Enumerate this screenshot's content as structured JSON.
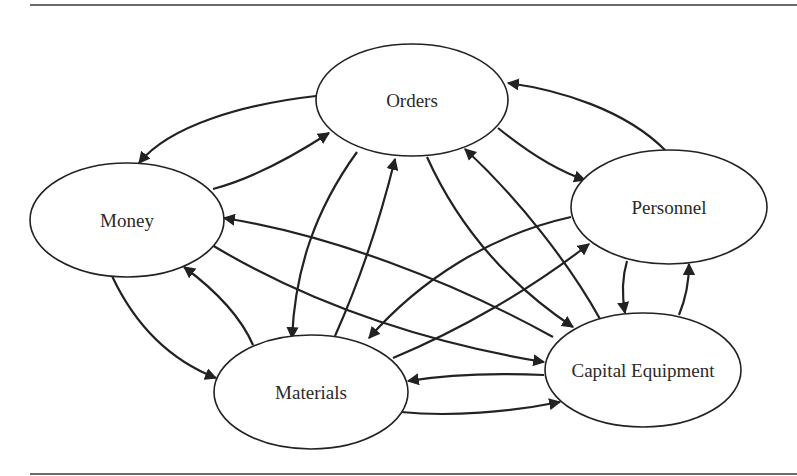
{
  "figure": {
    "rules": {
      "top": {
        "x1": 30,
        "x2": 797,
        "y": 4
      },
      "bottom": {
        "x1": 30,
        "x2": 797,
        "y": 473
      }
    },
    "colors": {
      "stroke": "#222222",
      "rule": "#6a6a6a",
      "text": "#2a2a2a",
      "background": "#ffffff"
    }
  },
  "nodes": [
    {
      "id": "orders",
      "label": "Orders",
      "cx": 412,
      "cy": 100,
      "rx": 96,
      "ry": 56
    },
    {
      "id": "money",
      "label": "Money",
      "cx": 127,
      "cy": 220,
      "rx": 97,
      "ry": 57
    },
    {
      "id": "personnel",
      "label": "Personnel",
      "cx": 669,
      "cy": 207,
      "rx": 98,
      "ry": 57
    },
    {
      "id": "materials",
      "label": "Materials",
      "cx": 311,
      "cy": 392,
      "rx": 97,
      "ry": 57
    },
    {
      "id": "capital-equipment",
      "label": "Capital Equipment",
      "cx": 643,
      "cy": 370,
      "rx": 98,
      "ry": 57
    }
  ],
  "edges": [
    {
      "from": "orders",
      "to": "money",
      "d": "M316,96 C245,104 170,125 139,163"
    },
    {
      "from": "money",
      "to": "orders",
      "d": "M213,189 C255,178 295,155 329,133"
    },
    {
      "from": "personnel",
      "to": "orders",
      "d": "M665,150 C625,110 560,90 508,83"
    },
    {
      "from": "orders",
      "to": "personnel",
      "d": "M498,128 C525,150 555,170 585,180"
    },
    {
      "from": "orders",
      "to": "materials",
      "d": "M357,152 C315,210 295,270 292,338"
    },
    {
      "from": "materials",
      "to": "orders",
      "d": "M335,336 C360,280 380,220 395,159"
    },
    {
      "from": "orders",
      "to": "capital-equipment",
      "d": "M427,157 C460,230 510,285 573,327"
    },
    {
      "from": "capital-equipment",
      "to": "orders",
      "d": "M600,319 C570,265 520,200 465,149"
    },
    {
      "from": "money",
      "to": "materials",
      "d": "M112,276 C135,325 170,360 216,378"
    },
    {
      "from": "materials",
      "to": "money",
      "d": "M253,345 C240,315 215,290 184,267"
    },
    {
      "from": "capital-equipment",
      "to": "money",
      "d": "M553,337 C450,280 330,235 224,218"
    },
    {
      "from": "money",
      "to": "capital-equipment",
      "d": "M212,245 C320,310 440,345 544,362"
    },
    {
      "from": "personnel",
      "to": "materials",
      "d": "M571,217 C490,235 420,280 369,338"
    },
    {
      "from": "materials",
      "to": "personnel",
      "d": "M393,358 C460,330 530,290 589,244"
    },
    {
      "from": "personnel",
      "to": "capital-equipment",
      "d": "M627,261 C622,278 622,296 625,313"
    },
    {
      "from": "capital-equipment",
      "to": "personnel",
      "d": "M679,315 C686,298 689,282 689,264"
    },
    {
      "from": "capital-equipment",
      "to": "materials",
      "d": "M544,375 C500,373 450,374 408,381"
    },
    {
      "from": "materials",
      "to": "capital-equipment",
      "d": "M401,412 C450,417 510,412 560,402"
    }
  ]
}
